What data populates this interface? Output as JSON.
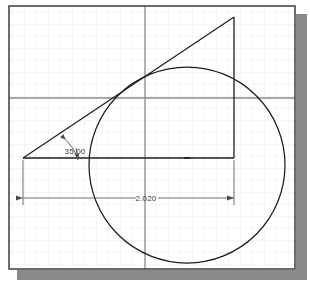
{
  "drawing": {
    "title": "Circle and tangent right triangle construction",
    "sheet": {
      "background_color": "#ffffff",
      "border_color": "#303030",
      "shadow_color": "#8a8a86"
    },
    "grid": {
      "visible": true,
      "minor_color": "#ededee",
      "minor_spacing_px": 12,
      "major_color": "#8b8b8f",
      "major_vertical_x": 145,
      "major_horizontal_y": 98
    },
    "geometry": {
      "circle": {
        "name": "circle",
        "cx": 187,
        "cy": 165,
        "r": 98,
        "stroke": "#1c1c1c"
      },
      "center_mark": {
        "name": "center-mark",
        "x": 187,
        "y": 158
      },
      "triangle": {
        "name": "right-triangle",
        "stroke": "#1c1c1c",
        "left_vertex": {
          "x": 23,
          "y": 158
        },
        "apex": {
          "x": 234,
          "y": 17
        },
        "corner": {
          "x": 234,
          "y": 158
        }
      }
    },
    "dimensions": [
      {
        "name": "angle-dimension",
        "type": "angular",
        "value": "35.00",
        "label_x": 75,
        "label_y": 154,
        "color": "#4a4a4a"
      },
      {
        "name": "linear-dimension",
        "type": "linear",
        "value": "2.020",
        "line_y": 198,
        "from_x": 23,
        "to_x": 234,
        "label_x": 146,
        "label_y": 200,
        "color": "#4a4a4a"
      }
    ]
  }
}
